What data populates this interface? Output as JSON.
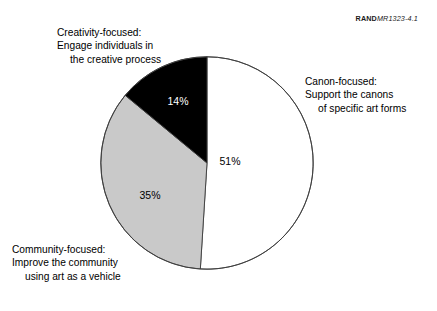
{
  "report_id": {
    "mark": "RAND",
    "number": "MR1323-4.1"
  },
  "chart_data": {
    "type": "pie",
    "title": "",
    "subtitle": "",
    "xlabel": "",
    "ylabel": "",
    "legend_position": "callout-labels",
    "grid": false,
    "start_angle_deg": 0,
    "direction": "clockwise",
    "categories": [
      "Canon-focused: Support the canons of specific art forms",
      "Community-focused: Improve the community using art as a vehicle",
      "Creativity-focused: Engage individuals in the creative process"
    ],
    "values": [
      51,
      35,
      14
    ],
    "value_labels": [
      "51%",
      "35%",
      "14%"
    ],
    "colors": [
      "#ffffff",
      "#c9c9c9",
      "#000000"
    ],
    "outline_color": "#3c3c3c",
    "slices": [
      {
        "name": "canon-focused",
        "value": 51,
        "value_label": "51%",
        "color": "#ffffff",
        "start_deg": 0,
        "end_deg": 183.6,
        "label_lines": [
          "Canon-focused:",
          "Support the canons",
          "of specific art forms"
        ]
      },
      {
        "name": "community-focused",
        "value": 35,
        "value_label": "35%",
        "color": "#c9c9c9",
        "start_deg": 183.6,
        "end_deg": 309.6,
        "label_lines": [
          "Community-focused:",
          "Improve the community",
          "using art as a vehicle"
        ]
      },
      {
        "name": "creativity-focused",
        "value": 14,
        "value_label": "14%",
        "color": "#000000",
        "start_deg": 309.6,
        "end_deg": 360,
        "label_lines": [
          "Creativity-focused:",
          "Engage individuals in",
          "the creative process"
        ]
      }
    ]
  }
}
